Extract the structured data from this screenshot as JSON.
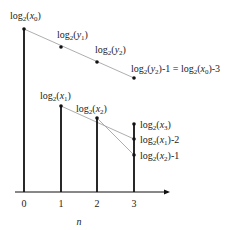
{
  "diagram": {
    "axis": {
      "x_label": "n",
      "ticks": [
        "0",
        "1",
        "2",
        "3"
      ]
    },
    "stems": [
      {
        "n": 0,
        "label": "log2(x0)"
      },
      {
        "n": 1,
        "label": "log2(x1)"
      },
      {
        "n": 2,
        "label": "log2(x2)"
      },
      {
        "n": 3,
        "label": "log2(x3)"
      }
    ],
    "points": {
      "y1": "log2(y1)",
      "y2": "log2(y2)",
      "y2_minus_1": "log2(y2)-1 = log2(x0)-3",
      "x1_minus_2": "log2(x1)-2",
      "x2_minus_1": "log2(x2)-1"
    },
    "colors": {
      "stem": "#111111",
      "guide_line": "#999999",
      "text": "#222222"
    }
  }
}
